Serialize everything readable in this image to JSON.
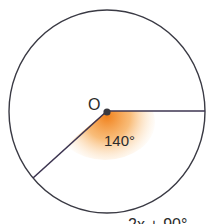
{
  "diagram": {
    "center_label": "O",
    "angle_label": "140°",
    "bottom_caption_partial": "2x + 90°",
    "angle_degrees": 140,
    "colors": {
      "stroke": "#3a3a44",
      "radius_stroke": "#3c3450",
      "highlight": "#f08a1e",
      "background": "#ffffff"
    }
  }
}
